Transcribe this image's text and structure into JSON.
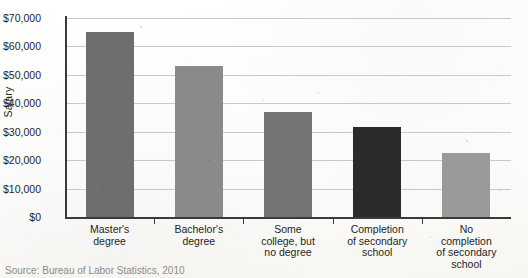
{
  "figure": {
    "source_note": "Source: Bureau of Labor Statistics, 2010"
  },
  "chart_data": {
    "type": "bar",
    "title": "",
    "xlabel": "",
    "ylabel": "Salary",
    "ylim": [
      0,
      70000
    ],
    "ytick_step": 10000,
    "grid": true,
    "legend": "none",
    "categories": [
      "Master's\ndegree",
      "Bachelor's\ndegree",
      "Some\ncollege, but\nno degree",
      "Completion\nof secondary\nschool",
      "No\ncompletion\nof secondary\nschool"
    ],
    "ytick_labels": [
      "$70,000",
      "$60,000",
      "$50,000",
      "$40,000",
      "$30,000",
      "$20,000",
      "$10,000",
      "$0"
    ],
    "ytick_values": [
      70000,
      60000,
      50000,
      40000,
      30000,
      20000,
      10000,
      0
    ],
    "values": [
      65000,
      53000,
      37000,
      31700,
      22500
    ],
    "bar_colors": [
      "#6e6e6e",
      "#8a8a8a",
      "#747474",
      "#2b2b2b",
      "#9a9a9a"
    ],
    "axis_color": "#3a3a3a",
    "grid_color": "#c9c9c9"
  }
}
